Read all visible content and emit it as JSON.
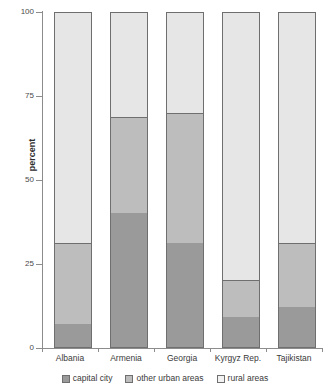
{
  "chart_data": {
    "type": "bar",
    "subtype": "stacked-bar-100",
    "title": "",
    "xlabel": "",
    "ylabel": "percent",
    "ylim": [
      0,
      100
    ],
    "yticks": [
      0,
      25,
      50,
      75,
      100
    ],
    "ytick_labels": [
      "0",
      "25",
      "50",
      "75",
      "100"
    ],
    "grid": false,
    "legend_position": "bottom",
    "categories": [
      "Albania",
      "Armenia",
      "Georgia",
      "Kyrgyz Rep.",
      "Tajikistan"
    ],
    "series": [
      {
        "name": "capital city",
        "color": "#9a9a9a",
        "values": [
          7,
          40,
          31,
          9,
          12
        ]
      },
      {
        "name": "other urban areas",
        "color": "#bdbdbd",
        "values": [
          24,
          29,
          39,
          11,
          19
        ]
      },
      {
        "name": "rural areas",
        "color": "#e6e6e6",
        "values": [
          69,
          31,
          30,
          80,
          69
        ]
      }
    ],
    "cumulative_tops": {
      "capital city": [
        7,
        40,
        31,
        9,
        12
      ],
      "other urban areas": [
        31,
        69,
        70,
        20,
        31
      ],
      "rural areas": [
        100,
        100,
        100,
        100,
        100
      ]
    }
  },
  "axis": {
    "y_title": "percent",
    "y_tick_labels": [
      "100",
      "75",
      "50",
      "25",
      "0"
    ]
  },
  "legend": {
    "items": [
      {
        "label": "capital city"
      },
      {
        "label": "other urban areas"
      },
      {
        "label": "rural areas"
      }
    ]
  },
  "x_labels": [
    "Albania",
    "Armenia",
    "Georgia",
    "Kyrgyz Rep.",
    "Tajikistan"
  ]
}
